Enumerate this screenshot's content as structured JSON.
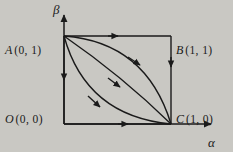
{
  "figure": {
    "background_color": "#c9c8c3",
    "line_color": "#1a1a1a",
    "axes": {
      "x_label": "α",
      "y_label": "β",
      "x_name": "alpha-axis",
      "y_name": "beta-axis"
    },
    "points": [
      {
        "id": "A",
        "name": "A",
        "coords": "(0, 1)",
        "label": "A (0, 1)"
      },
      {
        "id": "B",
        "name": "B",
        "coords": "(1, 1)",
        "label": "B (1, 1)"
      },
      {
        "id": "O",
        "name": "O",
        "coords": "(0, 0)",
        "label": "O (0, 0)"
      },
      {
        "id": "C",
        "name": "C",
        "coords": "(1, 0)",
        "label": "C (1, 0)"
      }
    ],
    "paths": [
      {
        "id": "top-edge",
        "from": "A",
        "to": "B",
        "shape": "straight",
        "direction": "right"
      },
      {
        "id": "right-edge",
        "from": "B",
        "to": "C",
        "shape": "straight",
        "direction": "down"
      },
      {
        "id": "left-edge",
        "from": "A",
        "to": "O",
        "shape": "straight",
        "direction": "down"
      },
      {
        "id": "bottom-edge",
        "from": "O",
        "to": "C",
        "shape": "straight",
        "direction": "right"
      },
      {
        "id": "upper-curve",
        "from": "A",
        "to": "C",
        "shape": "convex-up",
        "direction": "down-right"
      },
      {
        "id": "middle-curve",
        "from": "A",
        "to": "C",
        "shape": "near-straight",
        "direction": "down-right"
      },
      {
        "id": "lower-curve",
        "from": "A",
        "to": "C",
        "shape": "concave-down",
        "direction": "down-right"
      }
    ]
  }
}
